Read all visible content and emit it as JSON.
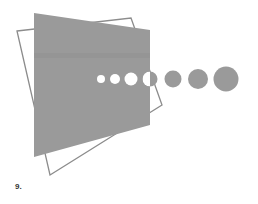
{
  "figure": {
    "panel_label": "9.",
    "colors": {
      "fill": "#9a9a9a",
      "band": "#8f8f8f",
      "outline": "#8c8c8c",
      "background": "#ffffff",
      "hole": "#ffffff"
    },
    "outline_rect_points": "17,31 131,18 162,105 50,175",
    "filled_shape_points": "34,13 150,30 150,125 34,157",
    "band": {
      "y": 53,
      "height": 5
    },
    "circles": [
      {
        "cx": 101,
        "cy": 79,
        "r": 4,
        "style": "white"
      },
      {
        "cx": 115,
        "cy": 79,
        "r": 5,
        "style": "white"
      },
      {
        "cx": 131,
        "cy": 79,
        "r": 6.5,
        "style": "white"
      },
      {
        "cx": 150,
        "cy": 79,
        "r": 7.5,
        "style": "split"
      },
      {
        "cx": 173,
        "cy": 79,
        "r": 8.5,
        "style": "gray"
      },
      {
        "cx": 198,
        "cy": 79,
        "r": 10,
        "style": "gray"
      },
      {
        "cx": 226,
        "cy": 79,
        "r": 12.5,
        "style": "gray"
      }
    ]
  }
}
